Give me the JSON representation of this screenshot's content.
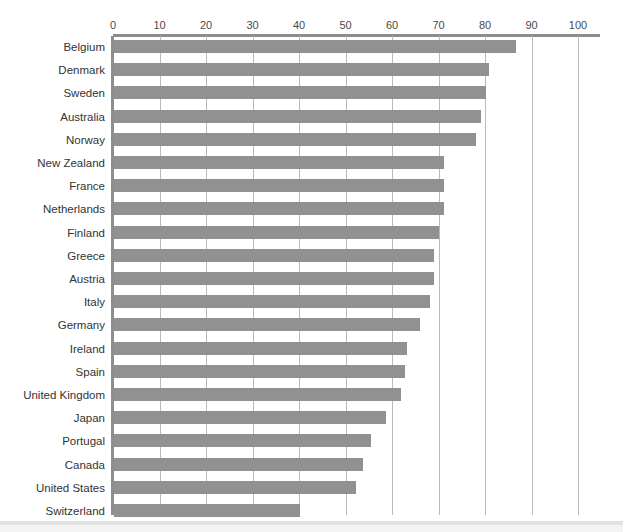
{
  "chart_data": {
    "type": "bar",
    "orientation": "horizontal",
    "title": "",
    "xlabel": "",
    "ylabel": "",
    "xlim": [
      0,
      100
    ],
    "xticks": [
      0,
      10,
      20,
      30,
      40,
      50,
      60,
      70,
      80,
      90,
      100
    ],
    "grid": true,
    "legend": false,
    "bar_color": "#919191",
    "axis_color": "#8c8c8c",
    "gridline_color": "#b9b9b9",
    "categories": [
      "Belgium",
      "Denmark",
      "Sweden",
      "Australia",
      "Norway",
      "New Zealand",
      "France",
      "Netherlands",
      "Finland",
      "Greece",
      "Austria",
      "Italy",
      "Germany",
      "Ireland",
      "Spain",
      "United Kingdom",
      "Japan",
      "Portugal",
      "Canada",
      "United States",
      "Switzerland"
    ],
    "values": [
      86.5,
      80.7,
      80.0,
      79.0,
      77.8,
      71.0,
      71.0,
      71.0,
      69.8,
      68.9,
      68.9,
      68.0,
      65.8,
      63.0,
      62.5,
      61.7,
      58.5,
      55.3,
      53.5,
      52.0,
      40.0
    ]
  }
}
